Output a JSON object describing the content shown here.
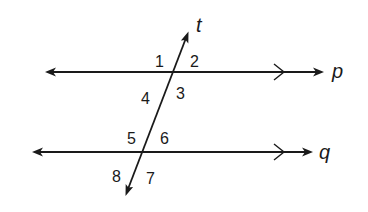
{
  "diagram": {
    "lines": {
      "t": {
        "label": "t",
        "role": "transversal"
      },
      "p": {
        "label": "p",
        "role": "parallel"
      },
      "q": {
        "label": "q",
        "role": "parallel"
      }
    },
    "angles": [
      {
        "label": "1",
        "intersection": "t-p",
        "position": "upper-left"
      },
      {
        "label": "2",
        "intersection": "t-p",
        "position": "upper-right"
      },
      {
        "label": "3",
        "intersection": "t-p",
        "position": "lower-right"
      },
      {
        "label": "4",
        "intersection": "t-p",
        "position": "lower-left"
      },
      {
        "label": "5",
        "intersection": "t-q",
        "position": "upper-left"
      },
      {
        "label": "6",
        "intersection": "t-q",
        "position": "upper-right"
      },
      {
        "label": "7",
        "intersection": "t-q",
        "position": "lower-right"
      },
      {
        "label": "8",
        "intersection": "t-q",
        "position": "lower-left"
      }
    ],
    "parallel_marks": {
      "p": ">",
      "q": ">"
    },
    "colors": {
      "stroke": "#1a1a1a",
      "background": "#ffffff"
    }
  }
}
